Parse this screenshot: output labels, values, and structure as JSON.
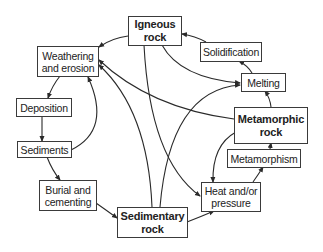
{
  "diagram": {
    "nodes": {
      "igneous": {
        "label": "Igneous\nrock",
        "emphasis": "bold"
      },
      "weathering": {
        "label": "Weathering\nand erosion",
        "emphasis": "normal"
      },
      "solidification": {
        "label": "Solidification",
        "emphasis": "normal"
      },
      "melting": {
        "label": "Melting",
        "emphasis": "normal"
      },
      "deposition": {
        "label": "Deposition",
        "emphasis": "normal"
      },
      "metamorphic": {
        "label": "Metamorphic\nrock",
        "emphasis": "bold"
      },
      "sediments": {
        "label": "Sediments",
        "emphasis": "normal"
      },
      "metamorphism": {
        "label": "Metamorphism",
        "emphasis": "normal"
      },
      "burial": {
        "label": "Burial and\ncementing",
        "emphasis": "normal"
      },
      "heat": {
        "label": "Heat and/or\npressure",
        "emphasis": "normal"
      },
      "sedimentary": {
        "label": "Sedimentary\nrock",
        "emphasis": "bold"
      }
    },
    "edges": [
      {
        "from": "igneous",
        "to": "weathering"
      },
      {
        "from": "igneous",
        "to": "melting"
      },
      {
        "from": "igneous",
        "to": "heat"
      },
      {
        "from": "solidification",
        "to": "igneous"
      },
      {
        "from": "melting",
        "to": "solidification"
      },
      {
        "from": "metamorphic",
        "to": "melting"
      },
      {
        "from": "metamorphic",
        "to": "weathering"
      },
      {
        "from": "metamorphic",
        "to": "heat"
      },
      {
        "from": "metamorphism",
        "to": "metamorphic"
      },
      {
        "from": "heat",
        "to": "metamorphism"
      },
      {
        "from": "weathering",
        "to": "deposition"
      },
      {
        "from": "deposition",
        "to": "sediments"
      },
      {
        "from": "sediments",
        "to": "weathering"
      },
      {
        "from": "sediments",
        "to": "burial"
      },
      {
        "from": "burial",
        "to": "sedimentary"
      },
      {
        "from": "sedimentary",
        "to": "weathering"
      },
      {
        "from": "sedimentary",
        "to": "melting"
      },
      {
        "from": "sedimentary",
        "to": "heat"
      }
    ],
    "colors": {
      "line": "#2a2a2a",
      "border": "#3a3a3a",
      "text": "#222222"
    }
  }
}
